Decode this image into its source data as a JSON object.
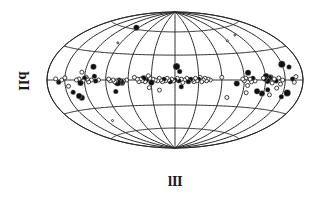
{
  "chart_data": {
    "type": "scatter",
    "projection": "hammer-aitoff",
    "title": "",
    "xlabel": "lII",
    "ylabel": "bII",
    "coordinate_system": "galactic",
    "grid": {
      "meridian_step_deg": 30,
      "parallel_step_deg": 30,
      "longitude_range": [
        -180,
        180
      ],
      "latitude_range": [
        -90,
        90
      ]
    },
    "legend": null,
    "points": [
      {
        "l": -168,
        "b": 3,
        "size": 2
      },
      {
        "l": -165,
        "b": -2,
        "size": 2
      },
      {
        "l": -162,
        "b": 1,
        "size": 2.5
      },
      {
        "l": -160,
        "b": 12,
        "size": 2.5
      },
      {
        "l": -157,
        "b": -12,
        "size": 3.5
      },
      {
        "l": -150,
        "b": -16,
        "size": 2.5
      },
      {
        "l": -150,
        "b": 15,
        "size": 3.5
      },
      {
        "l": -146,
        "b": 0,
        "size": 2
      },
      {
        "l": -143,
        "b": -4,
        "size": 2
      },
      {
        "l": -140,
        "b": 2,
        "size": 2
      },
      {
        "l": -138,
        "b": -8,
        "size": 2
      },
      {
        "l": -136,
        "b": -1,
        "size": 2.5
      },
      {
        "l": -133,
        "b": 1,
        "size": 2
      },
      {
        "l": -130,
        "b": -3,
        "size": 2
      },
      {
        "l": -128,
        "b": 3,
        "size": 2.5
      },
      {
        "l": -125,
        "b": 2,
        "size": 3.5
      },
      {
        "l": -123,
        "b": -1,
        "size": 3
      },
      {
        "l": -121,
        "b": 4,
        "size": 3
      },
      {
        "l": -119,
        "b": 1,
        "size": 2.5
      },
      {
        "l": -117,
        "b": 2,
        "size": 2
      },
      {
        "l": -125,
        "b": -10,
        "size": 2.5
      },
      {
        "l": -118,
        "b": -14,
        "size": 3
      },
      {
        "l": -130,
        "b": -15,
        "size": 2
      },
      {
        "l": -110,
        "b": -12,
        "size": 3
      },
      {
        "l": -105,
        "b": -1,
        "size": 2
      },
      {
        "l": -102,
        "b": 2,
        "size": 2.5
      },
      {
        "l": -100,
        "b": -2,
        "size": 2
      },
      {
        "l": -98,
        "b": 1,
        "size": 2
      },
      {
        "l": -96,
        "b": 8,
        "size": 3
      },
      {
        "l": -95,
        "b": -6,
        "size": 2
      },
      {
        "l": -92,
        "b": 2,
        "size": 2
      },
      {
        "l": -90,
        "b": -1,
        "size": 2
      },
      {
        "l": -88,
        "b": 1,
        "size": 2
      },
      {
        "l": -95,
        "b": -14,
        "size": 2
      },
      {
        "l": -80,
        "b": -4,
        "size": 3
      },
      {
        "l": -70,
        "b": -20,
        "size": 2
      },
      {
        "l": -60,
        "b": 3,
        "size": 2
      },
      {
        "l": -45,
        "b": 0,
        "size": 2
      },
      {
        "l": -42,
        "b": 1,
        "size": 2
      },
      {
        "l": -40,
        "b": -1,
        "size": 2
      },
      {
        "l": -38,
        "b": 2,
        "size": 2
      },
      {
        "l": -36,
        "b": 0,
        "size": 2
      },
      {
        "l": -34,
        "b": -2,
        "size": 2
      },
      {
        "l": -32,
        "b": 3,
        "size": 2
      },
      {
        "l": -30,
        "b": 1,
        "size": 2.5
      },
      {
        "l": -28,
        "b": -1,
        "size": 2
      },
      {
        "l": -26,
        "b": 2,
        "size": 2
      },
      {
        "l": -24,
        "b": -2,
        "size": 2
      },
      {
        "l": -22,
        "b": 0,
        "size": 2
      },
      {
        "l": -20,
        "b": 1,
        "size": 2.5
      },
      {
        "l": -17,
        "b": -2,
        "size": 2.5
      },
      {
        "l": -15,
        "b": 2,
        "size": 2
      },
      {
        "l": -12,
        "b": 0,
        "size": 2
      },
      {
        "l": -10,
        "b": -3,
        "size": 2
      },
      {
        "l": -8,
        "b": 1,
        "size": 2
      },
      {
        "l": -5,
        "b": -1,
        "size": 2.5
      },
      {
        "l": -3,
        "b": 2,
        "size": 2
      },
      {
        "l": -2,
        "b": 16,
        "size": 3.5
      },
      {
        "l": -6,
        "b": 10,
        "size": 2.5
      },
      {
        "l": -8,
        "b": -8,
        "size": 2.5
      },
      {
        "l": 0,
        "b": 0,
        "size": 2.5
      },
      {
        "l": 2,
        "b": -1,
        "size": 2
      },
      {
        "l": 4,
        "b": 1,
        "size": 2
      },
      {
        "l": 6,
        "b": -2,
        "size": 2.5
      },
      {
        "l": 8,
        "b": 0,
        "size": 2
      },
      {
        "l": 10,
        "b": 2,
        "size": 2
      },
      {
        "l": 12,
        "b": -1,
        "size": 2
      },
      {
        "l": 14,
        "b": 1,
        "size": 2.5
      },
      {
        "l": 16,
        "b": -2,
        "size": 2
      },
      {
        "l": 18,
        "b": 0,
        "size": 2
      },
      {
        "l": 20,
        "b": 2,
        "size": 2
      },
      {
        "l": 22,
        "b": -1,
        "size": 2
      },
      {
        "l": 25,
        "b": 0,
        "size": 2
      },
      {
        "l": 28,
        "b": 1,
        "size": 2
      },
      {
        "l": 30,
        "b": -3,
        "size": 3
      },
      {
        "l": 32,
        "b": 2,
        "size": 2
      },
      {
        "l": 34,
        "b": 5,
        "size": 2
      },
      {
        "l": 36,
        "b": 0,
        "size": 2.5
      },
      {
        "l": 38,
        "b": -2,
        "size": 2
      },
      {
        "l": 40,
        "b": 2,
        "size": 3
      },
      {
        "l": 42,
        "b": -1,
        "size": 2
      },
      {
        "l": 44,
        "b": 1,
        "size": 2
      },
      {
        "l": 46,
        "b": -2,
        "size": 2
      },
      {
        "l": 48,
        "b": 1,
        "size": 2
      },
      {
        "l": 52,
        "b": 3,
        "size": 2
      },
      {
        "l": 20,
        "b": -12,
        "size": 2
      },
      {
        "l": 33,
        "b": -9,
        "size": 2
      },
      {
        "l": 62,
        "b": 0,
        "size": 2
      },
      {
        "l": 66,
        "b": -1,
        "size": 2
      },
      {
        "l": 68,
        "b": -3,
        "size": 3
      },
      {
        "l": 70,
        "b": -2,
        "size": 3.5
      },
      {
        "l": 72,
        "b": 0,
        "size": 2.5
      },
      {
        "l": 74,
        "b": -3,
        "size": 3.5
      },
      {
        "l": 76,
        "b": -1,
        "size": 2
      },
      {
        "l": 78,
        "b": -2,
        "size": 2
      },
      {
        "l": 80,
        "b": 0,
        "size": 2
      },
      {
        "l": 84,
        "b": -1,
        "size": 2
      },
      {
        "l": 86,
        "b": 1,
        "size": 2
      },
      {
        "l": 78,
        "b": -13,
        "size": 2.5
      },
      {
        "l": 100,
        "b": 0,
        "size": 2
      },
      {
        "l": 104,
        "b": -1,
        "size": 2.5
      },
      {
        "l": 106,
        "b": 4,
        "size": 2.5
      },
      {
        "l": 110,
        "b": 0,
        "size": 2
      },
      {
        "l": 114,
        "b": -2,
        "size": 2
      },
      {
        "l": 116,
        "b": 1,
        "size": 2
      },
      {
        "l": 118,
        "b": 3,
        "size": 2
      },
      {
        "l": 120,
        "b": 2,
        "size": 2.5
      },
      {
        "l": 122,
        "b": -1,
        "size": 2
      },
      {
        "l": 126,
        "b": -3,
        "size": 3
      },
      {
        "l": 128,
        "b": 1,
        "size": 2
      },
      {
        "l": 132,
        "b": 0,
        "size": 2
      },
      {
        "l": 110,
        "b": 14,
        "size": 3
      },
      {
        "l": 125,
        "b": 8,
        "size": 2
      },
      {
        "l": 130,
        "b": -18,
        "size": 3
      },
      {
        "l": 133,
        "b": -16,
        "size": 3
      },
      {
        "l": 140,
        "b": -12,
        "size": 2.5
      },
      {
        "l": 145,
        "b": -6,
        "size": 2
      },
      {
        "l": 150,
        "b": 2,
        "size": 2
      },
      {
        "l": 155,
        "b": 0,
        "size": 2
      },
      {
        "l": 160,
        "b": -2,
        "size": 2.5
      },
      {
        "l": 165,
        "b": 1,
        "size": 2
      },
      {
        "l": 95,
        "b": 62,
        "size": 3
      },
      {
        "l": 95,
        "b": 42,
        "size": 1
      },
      {
        "l": -90,
        "b": 45,
        "size": 1
      },
      {
        "l": -115,
        "b": 50,
        "size": 1
      },
      {
        "l": 110,
        "b": -45,
        "size": 1
      }
    ]
  }
}
